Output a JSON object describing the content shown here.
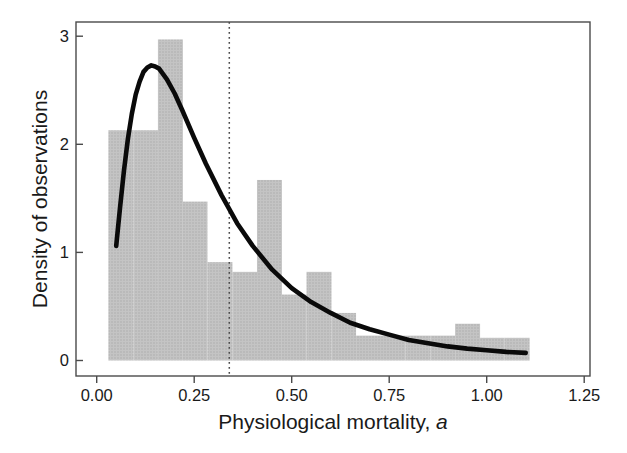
{
  "figure": {
    "background": "#ffffff"
  },
  "chart_data": {
    "type": "histogram",
    "title": "",
    "xlabel": "Physiological mortality, ",
    "xlabel_italic_suffix": "a",
    "ylabel": "Density of observations",
    "xlim": [
      -0.053,
      1.265
    ],
    "ylim": [
      -0.143,
      3.113
    ],
    "grid": false,
    "legend": "none",
    "x_ticks": {
      "values": [
        0,
        0.25,
        0.5,
        0.75,
        1.0,
        1.25
      ],
      "labels": [
        "0.00",
        "0.25",
        "0.50",
        "0.75",
        "1.00",
        "1.25"
      ]
    },
    "y_ticks": {
      "values": [
        0,
        1,
        2,
        3
      ],
      "labels": [
        "0",
        "1",
        "2",
        "3"
      ]
    },
    "histogram": {
      "bin_edges": [
        0.03,
        0.094,
        0.157,
        0.221,
        0.284,
        0.348,
        0.411,
        0.475,
        0.538,
        0.602,
        0.665,
        0.729,
        0.792,
        0.856,
        0.919,
        0.983,
        1.046,
        1.11
      ],
      "densities": [
        2.13,
        2.13,
        2.97,
        1.47,
        0.91,
        0.82,
        1.67,
        0.61,
        0.82,
        0.44,
        0.23,
        0.23,
        0.23,
        0.23,
        0.34,
        0.21,
        0.21
      ]
    },
    "fit_curve": {
      "name": "lognormal-fit",
      "points": [
        [
          0.05,
          1.06
        ],
        [
          0.06,
          1.42
        ],
        [
          0.07,
          1.76
        ],
        [
          0.08,
          2.05
        ],
        [
          0.09,
          2.28
        ],
        [
          0.1,
          2.46
        ],
        [
          0.11,
          2.58
        ],
        [
          0.12,
          2.67
        ],
        [
          0.13,
          2.71
        ],
        [
          0.14,
          2.73
        ],
        [
          0.15,
          2.72
        ],
        [
          0.16,
          2.7
        ],
        [
          0.18,
          2.6
        ],
        [
          0.2,
          2.47
        ],
        [
          0.22,
          2.31
        ],
        [
          0.25,
          2.06
        ],
        [
          0.28,
          1.82
        ],
        [
          0.32,
          1.53
        ],
        [
          0.36,
          1.27
        ],
        [
          0.4,
          1.06
        ],
        [
          0.45,
          0.84
        ],
        [
          0.5,
          0.67
        ],
        [
          0.55,
          0.54
        ],
        [
          0.6,
          0.44
        ],
        [
          0.65,
          0.35
        ],
        [
          0.7,
          0.29
        ],
        [
          0.75,
          0.24
        ],
        [
          0.8,
          0.19
        ],
        [
          0.85,
          0.16
        ],
        [
          0.9,
          0.13
        ],
        [
          0.95,
          0.11
        ],
        [
          1.0,
          0.095
        ],
        [
          1.05,
          0.08
        ],
        [
          1.1,
          0.07
        ]
      ]
    },
    "reference_line": {
      "x": 0.34,
      "style": "dotted"
    },
    "colors": {
      "bar_fill": "#c4c4c4",
      "bar_dot": "#a8a8a8",
      "curve": "#0a0a0a",
      "axis": "#4a4a4a",
      "reference_line": "#4a4a4a",
      "text": "#1a1a1a"
    }
  }
}
